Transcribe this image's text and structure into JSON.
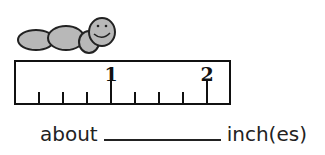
{
  "illustration": {
    "icon": "worm-icon",
    "fill": "#b8b8b8",
    "stroke": "#222222"
  },
  "ruler": {
    "labels": [
      {
        "text": "1",
        "pos_px": 95
      },
      {
        "text": "2",
        "pos_px": 191
      }
    ],
    "ticks_px": [
      23,
      47,
      71,
      95,
      119,
      143,
      167,
      191
    ],
    "whole_ticks_px": [
      95,
      191
    ]
  },
  "answer": {
    "prefix": "about",
    "blank": "",
    "suffix": "inch(es)"
  }
}
